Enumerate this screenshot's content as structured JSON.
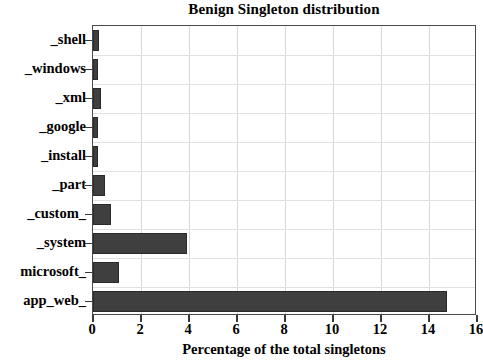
{
  "chart_data": {
    "type": "bar",
    "orientation": "horizontal",
    "title": "Benign Singleton distribution",
    "xlabel": "Percentage of the total singletons",
    "ylabel": "",
    "xlim": [
      0,
      16
    ],
    "xticks": [
      0,
      2,
      4,
      6,
      8,
      10,
      12,
      14,
      16
    ],
    "xticklabels": [
      "0",
      "2",
      "4",
      "6",
      "8",
      "10",
      "12",
      "14",
      "16"
    ],
    "grid": true,
    "legend": null,
    "categories": [
      "_shell",
      "_windows",
      "_xml",
      "_google",
      "_install",
      "_part",
      "_custom_",
      "_system",
      "microsoft_",
      "app_web_"
    ],
    "values": [
      0.25,
      0.2,
      0.35,
      0.2,
      0.2,
      0.5,
      0.75,
      3.9,
      1.1,
      14.75
    ],
    "bar_color": "#3f3f3f",
    "background_color": "#ffffff",
    "axis_color": "#4a4a4a"
  }
}
